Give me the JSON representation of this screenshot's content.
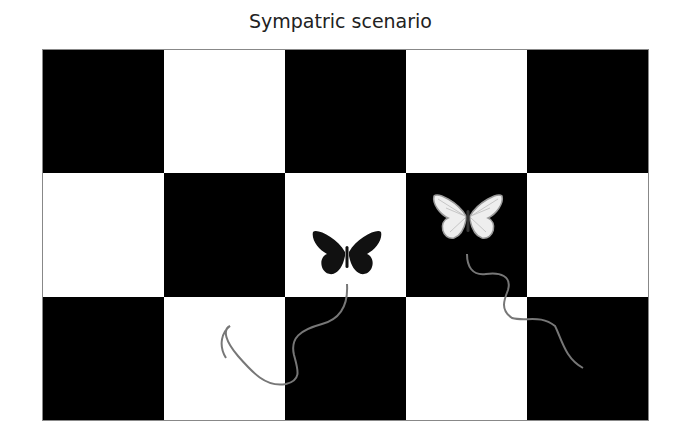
{
  "title": "Sympatric scenario",
  "board": {
    "rows": 3,
    "cols": 5,
    "cells": [
      [
        "black",
        "white",
        "black",
        "white",
        "black"
      ],
      [
        "white",
        "black",
        "white",
        "black",
        "white"
      ],
      [
        "black",
        "white",
        "black",
        "white",
        "black"
      ]
    ]
  },
  "butterflies": [
    {
      "name": "dark-butterfly",
      "color": "#111111",
      "position": "row 2, col 3 (white square)"
    },
    {
      "name": "light-butterfly",
      "color": "#f2f2f2",
      "position": "row 2, col 4 (black square)"
    }
  ],
  "colors": {
    "black": "#000000",
    "white": "#ffffff",
    "path": "#777777"
  }
}
